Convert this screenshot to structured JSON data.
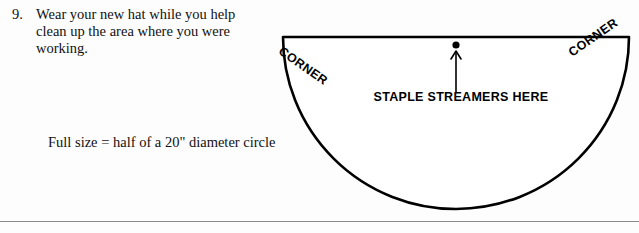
{
  "page": {
    "background_color": "#fdfdfd",
    "ink_color": "#111111",
    "rule_color": "#8a8a8a"
  },
  "instruction": {
    "number": "9.",
    "text": "Wear your new hat while you help clean up the area where you were working."
  },
  "caption": {
    "full_size": "Full size = half of a 20\" diameter circle"
  },
  "diagram": {
    "shape": "half-ellipse",
    "corner_left_label": "CORNER",
    "corner_right_label": "CORNER",
    "staple_label": "STAPLE STREAMERS HERE",
    "stroke_color": "#000000"
  }
}
